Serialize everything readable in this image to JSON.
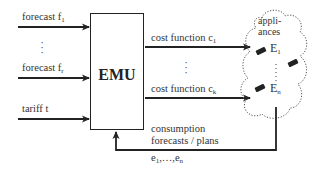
{
  "inputs": [
    {
      "label": "forecast f",
      "sub": "1"
    },
    {
      "label": "forecast f",
      "sub": "r"
    },
    {
      "label": "tariff t",
      "sub": ""
    }
  ],
  "emu": {
    "label": "EMU"
  },
  "outputs": [
    {
      "label": "cost function c",
      "sub": "1"
    },
    {
      "label": "cost function c",
      "sub": "k"
    }
  ],
  "cloud": {
    "title_line1": "appli-",
    "title_line2": "ances",
    "devices": [
      {
        "label": "E",
        "sub": "1"
      },
      {
        "label": "E",
        "sub": "n"
      }
    ]
  },
  "feedback": {
    "line1": "consumption",
    "line2": "forecasts / plans",
    "line3_prefix": "e",
    "line3_sub1": "1",
    "line3_mid": ",…,e",
    "line3_sub2": "n"
  },
  "ellipsis": "⋮",
  "colors": {
    "line": "#222222",
    "cloud": "#555555",
    "background": "#ffffff"
  }
}
